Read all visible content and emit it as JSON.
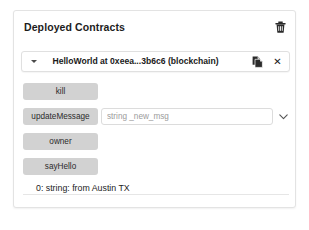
{
  "panel": {
    "title": "Deployed Contracts",
    "delete_icon": "trash-icon"
  },
  "instance": {
    "expand_icon": "caret-down-icon",
    "label": "HelloWorld at 0xeea...3b6c6 (blockchain)",
    "copy_icon": "copy-icon",
    "copy_label": "",
    "close_icon": "close-icon",
    "close_label": "✕"
  },
  "functions": [
    {
      "name": "kill",
      "label": "kill",
      "has_input": false,
      "input_placeholder": "",
      "input_value": "",
      "has_chevron": false
    },
    {
      "name": "updateMessage",
      "label": "updateMessage",
      "has_input": true,
      "input_placeholder": "string _new_msg",
      "input_value": "",
      "has_chevron": true,
      "chevron_icon": "chevron-down-icon"
    },
    {
      "name": "owner",
      "label": "owner",
      "has_input": false,
      "input_placeholder": "",
      "input_value": "",
      "has_chevron": false
    },
    {
      "name": "sayHello",
      "label": "sayHello",
      "has_input": false,
      "input_placeholder": "",
      "input_value": "",
      "has_chevron": false
    }
  ],
  "output": {
    "text": "0: string: from Austin TX"
  },
  "colors": {
    "button_gray": "#d2d2d2",
    "panel_border": "#e3e3e3",
    "text_dark": "#1c1c1c",
    "placeholder": "#9b9b9b"
  }
}
